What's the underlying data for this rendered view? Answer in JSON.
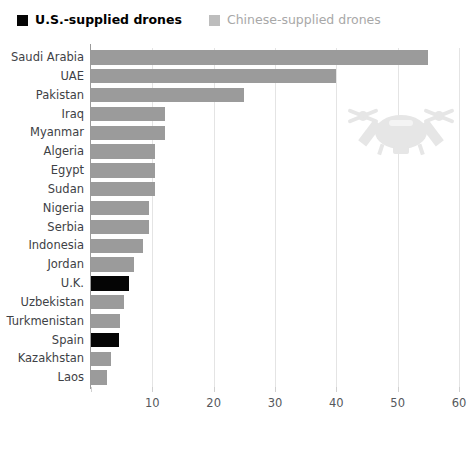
{
  "legend": {
    "items": [
      {
        "label": "U.S.-supplied drones",
        "color": "#050505",
        "key": "us"
      },
      {
        "label": "Chinese-supplied drones",
        "color": "#9b9b9b",
        "key": "cn"
      }
    ]
  },
  "watermark": {
    "icon": "drone-icon",
    "color": "#e8e8e8"
  },
  "chart_data": {
    "type": "bar",
    "orientation": "horizontal",
    "title": "",
    "subtitle": "",
    "xlabel": "",
    "ylabel": "",
    "xlim": [
      0,
      60
    ],
    "xticks": [
      0,
      10,
      20,
      30,
      40,
      50,
      60
    ],
    "xtick_labels": [
      "",
      "10",
      "20",
      "30",
      "40",
      "50",
      "60"
    ],
    "grid": true,
    "grid_axis": "x",
    "legend_position": "top-left",
    "categories": [
      "Saudi Arabia",
      "UAE",
      "Pakistan",
      "Iraq",
      "Myanmar",
      "Algeria",
      "Egypt",
      "Sudan",
      "Nigeria",
      "Serbia",
      "Indonesia",
      "Jordan",
      "U.K.",
      "Uzbekistan",
      "Turkmenistan",
      "Spain",
      "Kazakhstan",
      "Laos"
    ],
    "values": [
      55,
      40,
      25,
      12,
      12,
      10.5,
      10.5,
      10.5,
      9.5,
      9.5,
      8.5,
      7,
      6.2,
      5.4,
      4.8,
      4.5,
      3.2,
      2.6
    ],
    "supplier": [
      "cn",
      "cn",
      "cn",
      "cn",
      "cn",
      "cn",
      "cn",
      "cn",
      "cn",
      "cn",
      "cn",
      "cn",
      "us",
      "cn",
      "cn",
      "us",
      "cn",
      "cn"
    ],
    "series": [
      {
        "name": "Chinese-supplied drones",
        "color": "#9b9b9b",
        "values": [
          55,
          40,
          25,
          12,
          12,
          10.5,
          10.5,
          10.5,
          9.5,
          9.5,
          8.5,
          7,
          null,
          5.4,
          4.8,
          null,
          3.2,
          2.6
        ]
      },
      {
        "name": "U.S.-supplied drones",
        "color": "#050505",
        "values": [
          null,
          null,
          null,
          null,
          null,
          null,
          null,
          null,
          null,
          null,
          null,
          null,
          6.2,
          null,
          null,
          4.5,
          null,
          null
        ]
      }
    ]
  }
}
